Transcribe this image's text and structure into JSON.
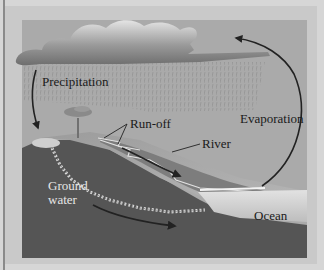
{
  "diagram": {
    "labels": {
      "precipitation": "Precipitation",
      "runoff": "Run-off",
      "river": "River",
      "evaporation": "Evaporation",
      "groundwater_line1": "Ground",
      "groundwater_line2": "water",
      "ocean": "Ocean"
    },
    "colors": {
      "frame_outer": "#d6d6d6",
      "sky": "#a9a9a9",
      "cloud_light": "#e8e8e8",
      "cloud_dark": "#7a7a7a",
      "ground_dark": "#555555",
      "ground_mid": "#8e8e8e",
      "river_band": "#7d7d7d",
      "ocean": "#d0d0d0",
      "arrow": "#222222"
    }
  }
}
